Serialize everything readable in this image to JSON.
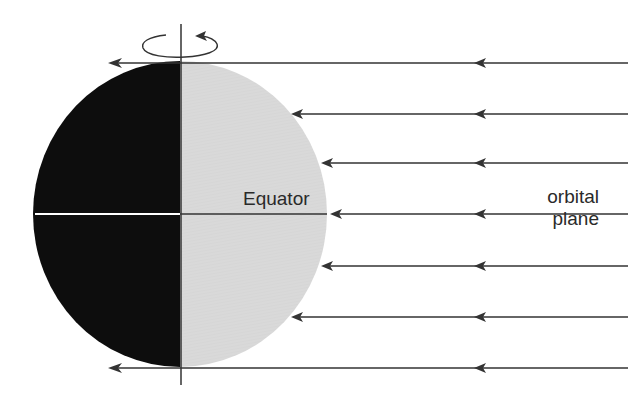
{
  "diagram": {
    "labels": {
      "equator": "Equator",
      "orbital_line1": "orbital",
      "orbital_line2": "plane"
    },
    "colors": {
      "night_side": "#0d0d0d",
      "day_side": "#e6e6e6",
      "lines": "#333333",
      "equator_on_night": "#ffffff",
      "background": "#ffffff"
    },
    "icons": {
      "rotation": "counterclockwise-rotation-arrow-icon",
      "sunlight_rays": "left-pointing-arrow-icon"
    },
    "sunlight_rays": [
      {
        "y": 63,
        "tip_x": 108
      },
      {
        "y": 114,
        "tip_x": 291
      },
      {
        "y": 163,
        "tip_x": 322
      },
      {
        "y": 214,
        "tip_x": 331
      },
      {
        "y": 266,
        "tip_x": 322
      },
      {
        "y": 317,
        "tip_x": 291
      },
      {
        "y": 368,
        "tip_x": 108
      }
    ]
  }
}
